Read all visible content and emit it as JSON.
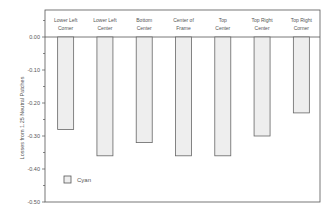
{
  "chart_data": {
    "type": "bar",
    "title": "",
    "xlabel": "",
    "ylabel": "Losses from 1.25 Neutral Patches",
    "categories": [
      [
        "Lower Left",
        "Corner"
      ],
      [
        "Lower Left",
        "Center"
      ],
      [
        "Bottom",
        "Center"
      ],
      [
        "Center of",
        "Frame"
      ],
      [
        "Top",
        "Center"
      ],
      [
        "Top Right",
        "Center"
      ],
      [
        "Top Right",
        "Corner"
      ]
    ],
    "series": [
      {
        "name": "Cyan",
        "values": [
          -0.28,
          -0.36,
          -0.32,
          -0.36,
          -0.36,
          -0.3,
          -0.23
        ],
        "color": "#eeeeee",
        "edge": "#666666"
      }
    ],
    "ylim": [
      -0.5,
      0.08
    ],
    "yticks": [
      0.0,
      -0.1,
      -0.2,
      -0.3,
      -0.4,
      -0.5
    ],
    "ytick_labels": [
      "0.00",
      "-0.10",
      "-0.20",
      "-0.30",
      "-0.40",
      "-0.50"
    ],
    "grid": false,
    "legend": {
      "position": "lower-left",
      "entries": [
        "Cyan"
      ]
    }
  }
}
